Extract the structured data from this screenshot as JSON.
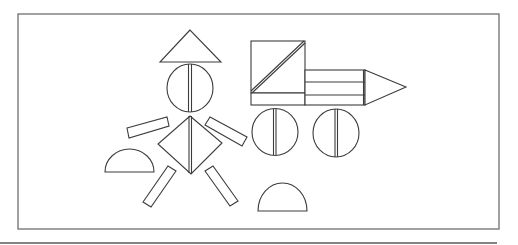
{
  "figure": {
    "stroke_color": "#3c3c3c",
    "frame_color": "#6f6f6f",
    "background": "#ffffff",
    "groups": [
      {
        "name": "person",
        "parts": [
          "hat-triangle",
          "head-circle",
          "body-diamond",
          "left-arm",
          "right-arm",
          "left-leg",
          "right-leg"
        ]
      },
      {
        "name": "vehicle",
        "parts": [
          "cab-square",
          "cab-diagonal",
          "body-rectangles",
          "nose-triangle",
          "front-wheel",
          "rear-wheel"
        ]
      },
      {
        "name": "loose-pieces",
        "parts": [
          "left-semicircle",
          "bottom-semicircle"
        ]
      }
    ]
  }
}
